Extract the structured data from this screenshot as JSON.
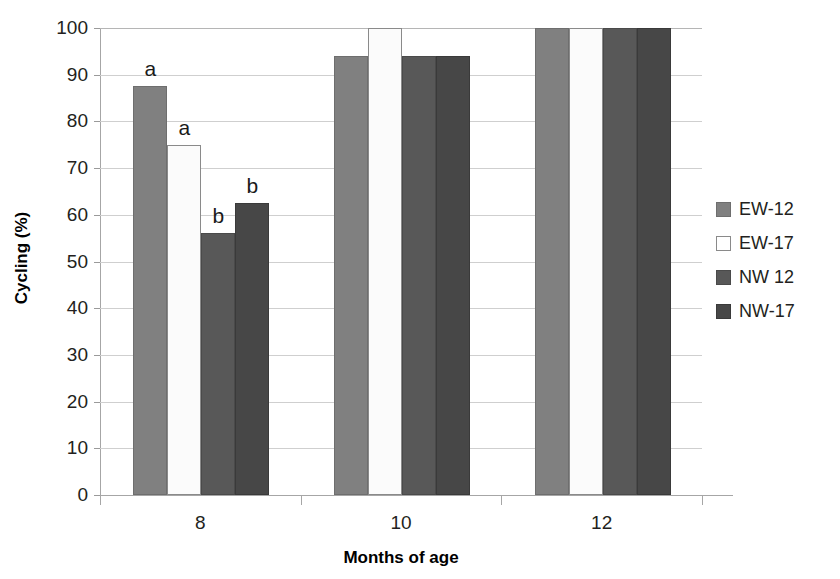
{
  "chart_data": {
    "type": "bar",
    "title": "",
    "xlabel": "Months of age",
    "ylabel": "Cycling (%)",
    "categories": [
      "8",
      "10",
      "12"
    ],
    "ylim": [
      0,
      100
    ],
    "ytick_labels": [
      "0",
      "10",
      "20",
      "30",
      "40",
      "50",
      "60",
      "70",
      "80",
      "90",
      "100"
    ],
    "ytick_values": [
      0,
      10,
      20,
      30,
      40,
      50,
      60,
      70,
      80,
      90,
      100
    ],
    "grid": "horizontal",
    "legend_position": "right",
    "series": [
      {
        "name": "EW-12",
        "color": "#808080",
        "values": [
          87.5,
          94,
          100
        ],
        "annotations": [
          "a",
          "",
          ""
        ]
      },
      {
        "name": "EW-17",
        "color": "#ffffff",
        "values": [
          75,
          100,
          100
        ],
        "annotations": [
          "a",
          "",
          ""
        ]
      },
      {
        "name": "NW 12",
        "color": "#585858",
        "values": [
          56,
          94,
          100
        ],
        "annotations": [
          "b",
          "",
          ""
        ]
      },
      {
        "name": "NW-17",
        "color": "#474747",
        "values": [
          62.5,
          94,
          100
        ],
        "annotations": [
          "b",
          "",
          ""
        ]
      }
    ]
  }
}
